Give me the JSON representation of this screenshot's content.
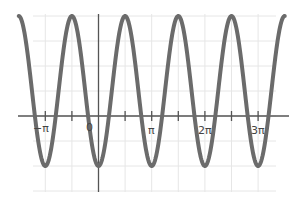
{
  "chart_data": {
    "type": "line",
    "title": "",
    "xlabel": "",
    "ylabel": "",
    "function": "y = 0.5 - 1.5 cos(2x)",
    "xlim": [
      -4.65,
      5.15
    ],
    "ylim": [
      -1.5,
      2.0
    ],
    "grid": true,
    "legend": null,
    "x_ticks": [
      {
        "value": -3.14159,
        "label": "−π"
      },
      {
        "value": -1.5708,
        "label": ""
      },
      {
        "value": 0,
        "label": "0"
      },
      {
        "value": 1.5708,
        "label": ""
      },
      {
        "value": 3.14159,
        "label": "π"
      },
      {
        "value": 4.71239,
        "label": ""
      },
      {
        "value": 6.28319,
        "label": "2π"
      },
      {
        "value": 7.85398,
        "label": ""
      },
      {
        "value": 9.42478,
        "label": "3π"
      }
    ],
    "x_range_plotted": [
      -4.71,
      11.0
    ],
    "series": [
      {
        "name": "curve",
        "color": "#6b6b6b",
        "x": [
          -4.712,
          -3.142,
          -1.571,
          0,
          1.571,
          3.142,
          4.712,
          6.283,
          7.854,
          9.425,
          10.996
        ],
        "y": [
          2,
          -1,
          2,
          -1,
          2,
          -1,
          2,
          -1,
          2,
          -1,
          2
        ]
      }
    ],
    "extrema": {
      "maxima_x": [
        "-3π/2",
        "-π/2",
        "π/2",
        "3π/2",
        "5π/2",
        "7π/2"
      ],
      "minima_x": [
        "-π",
        "0",
        "π",
        "2π",
        "3π"
      ],
      "max_y": 2,
      "min_y": -1
    }
  },
  "labels": {
    "neg_pi": "−π",
    "zero": "0",
    "pi": "π",
    "two_pi": "2π",
    "three_pi": "3π"
  }
}
